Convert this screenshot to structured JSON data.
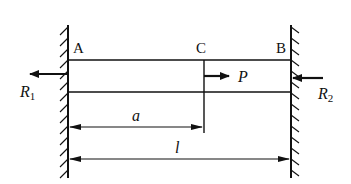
{
  "diagram": {
    "type": "fixed-fixed bar with axial point load",
    "colors": {
      "ink": "#111111",
      "background": "#ffffff"
    },
    "points": [
      {
        "id": "A",
        "label": "A"
      },
      {
        "id": "C",
        "label": "C"
      },
      {
        "id": "B",
        "label": "B"
      }
    ],
    "forces": {
      "load": {
        "symbol": "P",
        "direction": "right",
        "at": "C"
      },
      "reaction_left": {
        "symbol": "R",
        "subscript": "1",
        "direction": "left",
        "at": "A"
      },
      "reaction_right": {
        "symbol": "R",
        "subscript": "2",
        "direction": "left",
        "at": "B"
      }
    },
    "dimensions": {
      "a": {
        "label": "a",
        "from": "A",
        "to": "C"
      },
      "l": {
        "label": "l",
        "from": "A",
        "to": "B"
      }
    },
    "supports": [
      {
        "id": "left-wall",
        "hatch_side": "left"
      },
      {
        "id": "right-wall",
        "hatch_side": "right"
      }
    ]
  }
}
